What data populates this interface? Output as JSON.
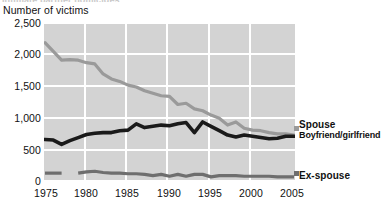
{
  "clipped_top_text": "Intimate partner homicides",
  "axis_title": "Number of victims",
  "labels": {
    "spouse": "Spouse",
    "boyfriend_girlfriend": "Boyfriend/girlfriend",
    "ex_spouse": "Ex-spouse"
  },
  "colors": {
    "plot_background": "#d3d3d3",
    "gridline": "#ffffff",
    "spouse_line": "#9a9a9a",
    "boyfriend_girlfriend_line": "#1a1a1a",
    "ex_spouse_line": "#6e6e6e",
    "text": "#111111"
  },
  "chart_data": {
    "type": "line",
    "title": "",
    "xlabel": "",
    "ylabel": "Number of victims",
    "xlim": [
      1975,
      2005
    ],
    "ylim": [
      0,
      2500
    ],
    "ytick_labels": [
      "2,500",
      "2,000",
      "1,500",
      "1,000",
      "500",
      "0"
    ],
    "ytick_values": [
      2500,
      2000,
      1500,
      1000,
      500,
      0
    ],
    "xtick_labels": [
      "1975",
      "1980",
      "1985",
      "1990",
      "1995",
      "2000",
      "2005"
    ],
    "xtick_values": [
      1975,
      1980,
      1985,
      1990,
      1995,
      2000,
      2005
    ],
    "grid": "horizontal-and-vertical",
    "legend_position": "right-inline-labels",
    "x": [
      1975,
      1976,
      1977,
      1978,
      1979,
      1980,
      1981,
      1982,
      1983,
      1984,
      1985,
      1986,
      1987,
      1988,
      1989,
      1990,
      1991,
      1992,
      1993,
      1994,
      1995,
      1996,
      1997,
      1998,
      1999,
      2000,
      2001,
      2002,
      2003,
      2004,
      2005
    ],
    "series": [
      {
        "name": "Spouse",
        "color": "#9a9a9a",
        "values": [
          2200,
          2060,
          1920,
          1930,
          1920,
          1880,
          1860,
          1700,
          1620,
          1580,
          1520,
          1490,
          1430,
          1390,
          1350,
          1340,
          1210,
          1230,
          1140,
          1110,
          1040,
          990,
          880,
          930,
          830,
          800,
          790,
          760,
          740,
          740,
          720
        ]
      },
      {
        "name": "Boyfriend/girlfriend",
        "color": "#1a1a1a",
        "values": [
          650,
          640,
          570,
          630,
          680,
          730,
          750,
          760,
          760,
          790,
          800,
          900,
          840,
          860,
          880,
          870,
          900,
          920,
          760,
          930,
          860,
          790,
          720,
          690,
          720,
          700,
          680,
          660,
          670,
          700,
          700
        ]
      },
      {
        "name": "Ex-spouse",
        "color": "#6e6e6e",
        "values": [
          110,
          110,
          110,
          null,
          110,
          130,
          140,
          120,
          110,
          110,
          100,
          100,
          90,
          70,
          90,
          60,
          90,
          60,
          90,
          90,
          50,
          70,
          70,
          70,
          60,
          60,
          60,
          60,
          50,
          50,
          50
        ]
      }
    ]
  }
}
